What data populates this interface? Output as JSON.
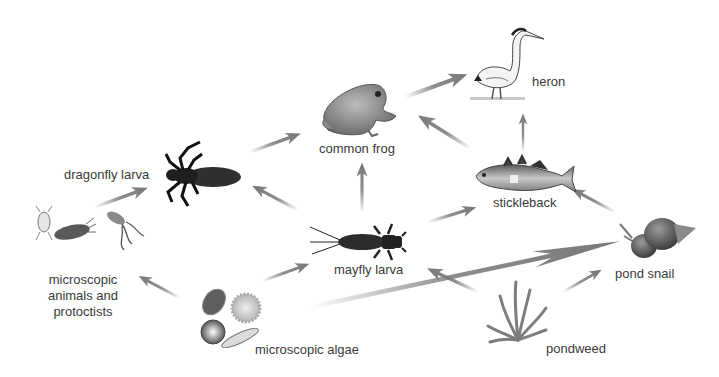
{
  "diagram": {
    "type": "food-web",
    "arrow_color": "#7a7a7a"
  },
  "organisms": {
    "heron": {
      "label": "heron"
    },
    "common_frog": {
      "label": "common frog"
    },
    "dragonfly_larva": {
      "label": "dragonfly larva"
    },
    "stickleback": {
      "label": "stickleback"
    },
    "mayfly_larva": {
      "label": "mayfly larva"
    },
    "microscopic_animals": {
      "label_line1": "microscopic",
      "label_line2": "animals and",
      "label_line3": "protoctists"
    },
    "pond_snail": {
      "label": "pond snail"
    },
    "microscopic_algae": {
      "label": "microscopic algae"
    },
    "pondweed": {
      "label": "pondweed"
    }
  },
  "links": [
    {
      "from": "common frog",
      "to": "heron"
    },
    {
      "from": "stickleback",
      "to": "heron"
    },
    {
      "from": "dragonfly larva",
      "to": "common frog"
    },
    {
      "from": "mayfly larva",
      "to": "common frog"
    },
    {
      "from": "stickleback",
      "to": "common frog"
    },
    {
      "from": "mayfly larva",
      "to": "dragonfly larva"
    },
    {
      "from": "microscopic animals and protoctists",
      "to": "dragonfly larva"
    },
    {
      "from": "mayfly larva",
      "to": "stickleback"
    },
    {
      "from": "pond snail",
      "to": "stickleback"
    },
    {
      "from": "microscopic algae",
      "to": "microscopic animals and protoctists"
    },
    {
      "from": "microscopic algae",
      "to": "mayfly larva"
    },
    {
      "from": "microscopic algae",
      "to": "pond snail"
    },
    {
      "from": "pondweed",
      "to": "mayfly larva"
    },
    {
      "from": "pondweed",
      "to": "pond snail"
    }
  ]
}
